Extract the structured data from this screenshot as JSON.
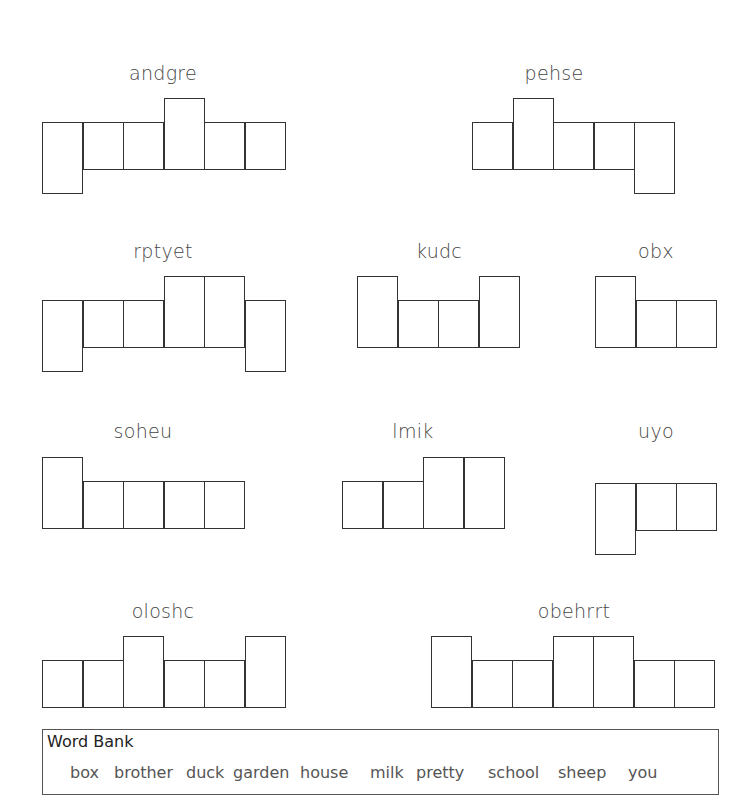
{
  "puzzles": [
    {
      "scramble": "andgre",
      "label_x": 163,
      "label_y": 62,
      "left": 42,
      "baseline_top": 122,
      "boxes": [
        "desc",
        "x",
        "x",
        "asc",
        "x",
        "x"
      ]
    },
    {
      "scramble": "pehse",
      "label_x": 554,
      "label_y": 62,
      "left": 472,
      "baseline_top": 122,
      "boxes": [
        "x",
        "asc",
        "x",
        "x",
        "desc"
      ]
    },
    {
      "scramble": "rptyet",
      "label_x": 163,
      "label_y": 240,
      "left": 42,
      "baseline_top": 300,
      "boxes": [
        "desc",
        "x",
        "x",
        "asc",
        "asc",
        "desc"
      ]
    },
    {
      "scramble": "kudc",
      "label_x": 439,
      "label_y": 240,
      "left": 357,
      "baseline_top": 300,
      "boxes": [
        "asc",
        "x",
        "x",
        "asc"
      ]
    },
    {
      "scramble": "obx",
      "label_x": 656,
      "label_y": 240,
      "left": 595,
      "baseline_top": 300,
      "boxes": [
        "asc",
        "x",
        "x"
      ]
    },
    {
      "scramble": "soheu",
      "label_x": 143,
      "label_y": 420,
      "left": 42,
      "baseline_top": 481,
      "boxes": [
        "asc",
        "x",
        "x",
        "x",
        "x"
      ]
    },
    {
      "scramble": "lmik",
      "label_x": 413,
      "label_y": 420,
      "left": 342,
      "baseline_top": 481,
      "boxes": [
        "x",
        "x",
        "asc",
        "asc"
      ]
    },
    {
      "scramble": "uyo",
      "label_x": 656,
      "label_y": 420,
      "left": 595,
      "baseline_top": 483,
      "boxes": [
        "desc",
        "x",
        "x"
      ]
    },
    {
      "scramble": "oloshc",
      "label_x": 163,
      "label_y": 600,
      "left": 42,
      "baseline_top": 660,
      "boxes": [
        "x",
        "x",
        "asc",
        "x",
        "x",
        "asc"
      ]
    },
    {
      "scramble": "obehrrt",
      "label_x": 574,
      "label_y": 600,
      "left": 431,
      "baseline_top": 660,
      "boxes": [
        "asc",
        "x",
        "x",
        "asc",
        "asc",
        "x",
        "x"
      ]
    }
  ],
  "word_bank": {
    "title": "Word Bank",
    "words": [
      {
        "text": "box",
        "x": 27
      },
      {
        "text": "brother",
        "x": 71
      },
      {
        "text": "duck",
        "x": 143
      },
      {
        "text": "garden",
        "x": 190
      },
      {
        "text": "house",
        "x": 257
      },
      {
        "text": "milk",
        "x": 327
      },
      {
        "text": "pretty",
        "x": 373
      },
      {
        "text": "school",
        "x": 445
      },
      {
        "text": "sheep",
        "x": 515
      },
      {
        "text": "you",
        "x": 585
      }
    ]
  }
}
